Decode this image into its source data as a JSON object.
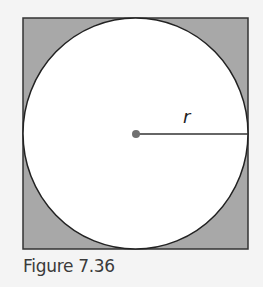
{
  "figure": {
    "caption": "Figure 7.36",
    "radius_label": "r",
    "colors": {
      "background": "#f4f4f4",
      "square_fill": "#a8a8a8",
      "circle_fill": "#ffffff",
      "stroke": "#333333",
      "center_dot": "#707070"
    }
  }
}
